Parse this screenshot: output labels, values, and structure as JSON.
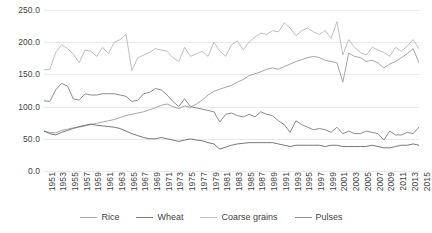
{
  "chart_data": {
    "type": "line",
    "title": "",
    "xlabel": "",
    "ylabel": "",
    "ylim": [
      0,
      250
    ],
    "yticks": [
      "0.0",
      "50.0",
      "100.0",
      "150.0",
      "200.0",
      "250.0"
    ],
    "grid": true,
    "legend_position": "bottom",
    "x": [
      1951,
      1952,
      1953,
      1954,
      1955,
      1956,
      1957,
      1958,
      1959,
      1960,
      1961,
      1962,
      1963,
      1964,
      1965,
      1966,
      1967,
      1968,
      1969,
      1970,
      1971,
      1972,
      1973,
      1974,
      1975,
      1976,
      1977,
      1978,
      1979,
      1980,
      1981,
      1982,
      1983,
      1984,
      1985,
      1986,
      1987,
      1988,
      1989,
      1990,
      1991,
      1992,
      1993,
      1994,
      1995,
      1996,
      1997,
      1998,
      1999,
      2000,
      2001,
      2002,
      2003,
      2004,
      2005,
      2006,
      2007,
      2008,
      2009,
      2010,
      2011,
      2012,
      2013,
      2014,
      2015
    ],
    "xtick_labels": [
      "1951",
      "1953",
      "1955",
      "1957",
      "1959",
      "1961",
      "1963",
      "1965",
      "1967",
      "1969",
      "1971",
      "1973",
      "1975",
      "1977",
      "1979",
      "1981",
      "1983",
      "1985",
      "1987",
      "1989",
      "1991",
      "1993",
      "1995",
      "1997",
      "1999",
      "2001",
      "2003",
      "2005",
      "2007",
      "2009",
      "2011",
      "2013",
      "2015"
    ],
    "series": [
      {
        "name": "Rice",
        "color": "#a6a6a6",
        "values": [
          62,
          60,
          59,
          63,
          65,
          67,
          68,
          70,
          72,
          74,
          76,
          78,
          80,
          83,
          86,
          88,
          90,
          92,
          95,
          98,
          102,
          104,
          100,
          97,
          101,
          99,
          104,
          110,
          118,
          124,
          127,
          130,
          133,
          138,
          142,
          148,
          151,
          154,
          158,
          160,
          158,
          162,
          166,
          170,
          173,
          176,
          178,
          176,
          172,
          170,
          168,
          138,
          183,
          178,
          176,
          170,
          172,
          168,
          160,
          166,
          170,
          176,
          182,
          190,
          168
        ]
      },
      {
        "name": "Wheat",
        "color": "#777777",
        "values": [
          62,
          58,
          56,
          60,
          63,
          66,
          69,
          71,
          73,
          71,
          70,
          69,
          68,
          66,
          62,
          58,
          55,
          52,
          50,
          50,
          52,
          50,
          48,
          46,
          48,
          50,
          48,
          47,
          44,
          42,
          34,
          37,
          40,
          42,
          43,
          44,
          44,
          44,
          44,
          44,
          42,
          40,
          38,
          40,
          40,
          40,
          40,
          40,
          38,
          40,
          40,
          38,
          38,
          38,
          38,
          38,
          40,
          38,
          36,
          36,
          38,
          40,
          40,
          42,
          40
        ]
      },
      {
        "name": "Coarse grains",
        "color": "#bfbfbf",
        "values": [
          157,
          158,
          184,
          196,
          190,
          182,
          168,
          188,
          186,
          178,
          192,
          182,
          200,
          204,
          212,
          156,
          176,
          180,
          184,
          190,
          188,
          186,
          176,
          170,
          192,
          178,
          182,
          186,
          178,
          200,
          186,
          178,
          196,
          202,
          188,
          200,
          208,
          214,
          212,
          218,
          216,
          230,
          222,
          210,
          218,
          222,
          216,
          212,
          218,
          206,
          232,
          180,
          204,
          192,
          184,
          180,
          192,
          188,
          184,
          178,
          192,
          186,
          194,
          204,
          190
        ]
      },
      {
        "name": "Pulses",
        "color": "#8c8c8c",
        "values": [
          109,
          108,
          126,
          136,
          132,
          112,
          110,
          120,
          118,
          118,
          120,
          120,
          120,
          118,
          116,
          108,
          110,
          120,
          122,
          128,
          126,
          118,
          108,
          100,
          112,
          100,
          98,
          96,
          94,
          92,
          76,
          88,
          90,
          86,
          84,
          88,
          84,
          92,
          88,
          86,
          78,
          72,
          60,
          78,
          72,
          68,
          64,
          66,
          64,
          60,
          68,
          58,
          62,
          58,
          58,
          62,
          60,
          58,
          48,
          62,
          56,
          56,
          60,
          58,
          68
        ]
      }
    ]
  },
  "axis": {
    "y_label_suffix": "",
    "x_first": "1951",
    "x_last": "2015"
  },
  "legend": {
    "items": [
      {
        "label": "Rice",
        "color": "#a6a6a6"
      },
      {
        "label": "Wheat",
        "color": "#777777"
      },
      {
        "label": "Coarse grains",
        "color": "#bfbfbf"
      },
      {
        "label": "Pulses",
        "color": "#8c8c8c"
      }
    ]
  }
}
